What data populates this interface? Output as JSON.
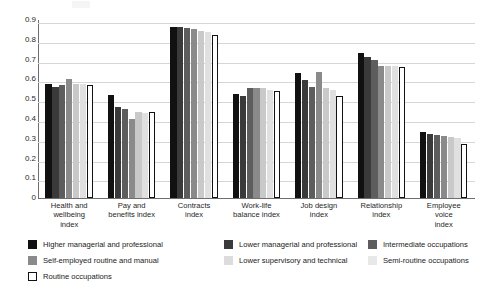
{
  "chart_data": {
    "type": "bar",
    "title": "",
    "xlabel": "",
    "ylabel": "",
    "ylim": [
      0,
      0.9
    ],
    "ytick_labels": [
      "0.9",
      "0.8",
      "0.7",
      "0.6",
      "0.5",
      "0.4",
      "0.3",
      "0.2",
      "0.1",
      "0"
    ],
    "ytick_values": [
      0.9,
      0.8,
      0.7,
      0.6,
      0.5,
      0.4,
      0.3,
      0.2,
      0.1,
      0
    ],
    "grid": true,
    "legend_position": "below",
    "categories": [
      "Health and wellbeing index",
      "Pay and benefits index",
      "Contracts index",
      "Work-life balance index",
      "Job design index",
      "Relationship index",
      "Employee voice index"
    ],
    "category_lines": [
      [
        "Health and",
        "wellbeing",
        "index"
      ],
      [
        "Pay and",
        "benefits index"
      ],
      [
        "Contracts",
        "index"
      ],
      [
        "Work-life",
        "balance index"
      ],
      [
        "Job design",
        "index"
      ],
      [
        "Relationship",
        "index"
      ],
      [
        "Employee",
        "voice",
        "index"
      ]
    ],
    "series": [
      {
        "name": "Higher  managerial and professional",
        "color": "#111111",
        "outlined": false,
        "values": [
          0.575,
          0.52,
          0.865,
          0.525,
          0.63,
          0.735,
          0.335
        ]
      },
      {
        "name": "Lower managerial and professional",
        "color": "#3a3a3a",
        "outlined": false,
        "values": [
          0.56,
          0.46,
          0.865,
          0.515,
          0.595,
          0.715,
          0.325
        ]
      },
      {
        "name": "Intermediate occupations",
        "color": "#5d5d5d",
        "outlined": false,
        "values": [
          0.57,
          0.45,
          0.86,
          0.555,
          0.56,
          0.7,
          0.32
        ]
      },
      {
        "name": "Self-employed routine and manual",
        "color": "#8a8a8a",
        "outlined": false,
        "values": [
          0.6,
          0.4,
          0.855,
          0.555,
          0.635,
          0.665,
          0.315
        ]
      },
      {
        "name": "Lower supervisory and technical",
        "color": "#c9c9c9",
        "outlined": false,
        "values": [
          0.578,
          0.435,
          0.845,
          0.555,
          0.555,
          0.67,
          0.31
        ]
      },
      {
        "name": "Semi-routine occupations",
        "color": "#e0e0e0",
        "outlined": false,
        "values": [
          0.578,
          0.43,
          0.84,
          0.545,
          0.545,
          0.67,
          0.305
        ]
      },
      {
        "name": "Routine occupations",
        "color": "#ffffff",
        "outlined": true,
        "values": [
          0.572,
          0.435,
          0.825,
          0.54,
          0.515,
          0.663,
          0.275
        ]
      }
    ]
  },
  "legend": {
    "entries": [
      {
        "label": "Higher  managerial and professional"
      },
      {
        "label": "Lower managerial and professional"
      },
      {
        "label": "Intermediate occupations"
      },
      {
        "label": "Self-employed routine and manual"
      },
      {
        "label": "Lower supervisory and technical"
      },
      {
        "label": "Semi-routine occupations"
      },
      {
        "label": "Routine occupations"
      }
    ]
  }
}
